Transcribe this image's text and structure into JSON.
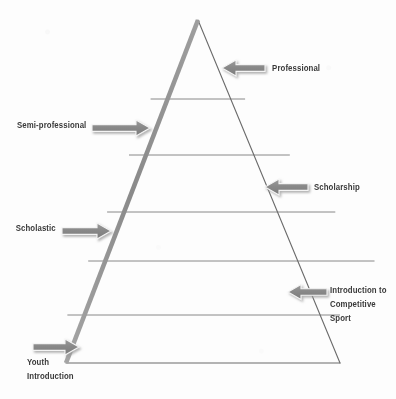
{
  "diagram": {
    "type": "pyramid",
    "tier_count": 6,
    "colors": {
      "left_edge": "#8c8c8c",
      "right_edge": "#6b6b6b",
      "divider": "#7a7a7a",
      "arrow_fill": "#8a8a8a",
      "arrow_outline": "#f2f2f2",
      "text": "#3a3a3a",
      "background": "#fdfdfd"
    },
    "geometry": {
      "apex_x": 198,
      "apex_y": 20,
      "base_left_x": 66,
      "base_right_x": 340,
      "base_y": 363,
      "divider_y": [
        99,
        155,
        212,
        261,
        315
      ]
    }
  },
  "annotations": [
    {
      "id": "professional",
      "label": "Professional",
      "lines": [
        "Professional"
      ],
      "arrow_direction": "left",
      "side": "right",
      "tier": 1
    },
    {
      "id": "semi-professional",
      "label": "Semi-professional",
      "lines": [
        "Semi-professional"
      ],
      "arrow_direction": "right",
      "side": "left",
      "tier": 2
    },
    {
      "id": "scholarship",
      "label": "Scholarship",
      "lines": [
        "Scholarship"
      ],
      "arrow_direction": "left",
      "side": "right",
      "tier": 3
    },
    {
      "id": "scholastic",
      "label": "Scholastic",
      "lines": [
        "Scholastic"
      ],
      "arrow_direction": "right",
      "side": "left",
      "tier": 4
    },
    {
      "id": "introduction-to-competitive-sport",
      "label": "Introduction to Competitive Sport",
      "lines": [
        "Introduction to",
        "Competitive",
        "Sport"
      ],
      "arrow_direction": "left",
      "side": "right",
      "tier": 5
    },
    {
      "id": "youth-introduction",
      "label": "Youth Introduction",
      "lines": [
        "Youth",
        "Introduction"
      ],
      "arrow_direction": "right",
      "side": "left",
      "tier": 6
    }
  ]
}
